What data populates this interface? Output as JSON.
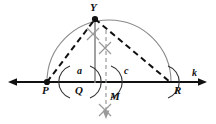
{
  "figure": {
    "background_color": "#ffffff",
    "stroke_color": "#111111",
    "arc_color": "#8a8a8a",
    "construction_color": "#9a9a9a"
  },
  "labels": {
    "apex_point": "Y",
    "left_point": "P",
    "foot_point": "Q",
    "right_point": "R",
    "midpoint_marker": "M",
    "left_segment": "a",
    "right_segment": "c",
    "line_name": "k"
  },
  "points": {
    "Y": {
      "x": 95,
      "y": 19
    },
    "P": {
      "x": 47,
      "y": 82
    },
    "Q": {
      "x": 95,
      "y": 82
    },
    "R": {
      "x": 170,
      "y": 82
    },
    "M": {
      "x": 106,
      "y": 82
    }
  },
  "line_k": {
    "y": 82,
    "x_start": 8,
    "x_end": 207,
    "arrows": "both"
  },
  "semicircle": {
    "center_x": 109,
    "center_y": 82,
    "radius": 62
  },
  "construction_marks": {
    "x_marks": [
      {
        "x": 93,
        "y": 34
      },
      {
        "x": 105,
        "y": 48
      },
      {
        "x": 105,
        "y": 110
      }
    ],
    "arc_brackets": [
      {
        "x": 68,
        "y": 82
      },
      {
        "x": 92,
        "y": 82
      },
      {
        "x": 113,
        "y": 82
      },
      {
        "x": 170,
        "y": 82
      }
    ],
    "vertical_solid": {
      "x": 95,
      "y_top": 19,
      "y_bottom": 82
    },
    "vertical_dashed": {
      "x": 106,
      "y_top": 30,
      "y_bottom": 119
    }
  }
}
